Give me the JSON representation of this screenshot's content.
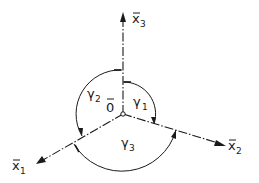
{
  "diagram": {
    "type": "coordinate-axes-with-angles",
    "origin": {
      "label": "0",
      "overbar": true
    },
    "axes": [
      {
        "id": "x1",
        "label": "x",
        "subscript": "1",
        "overbar": true,
        "direction": "lower-left"
      },
      {
        "id": "x2",
        "label": "x",
        "subscript": "2",
        "overbar": true,
        "direction": "lower-right"
      },
      {
        "id": "x3",
        "label": "x",
        "subscript": "3",
        "overbar": true,
        "direction": "up"
      }
    ],
    "angles": [
      {
        "id": "gamma1",
        "label": "γ",
        "subscript": "1",
        "from": "x3",
        "to": "x2"
      },
      {
        "id": "gamma2",
        "label": "γ",
        "subscript": "2",
        "from": "x3",
        "to": "x1"
      },
      {
        "id": "gamma3",
        "label": "γ",
        "subscript": "3",
        "from": "x1",
        "to": "x2"
      }
    ]
  }
}
